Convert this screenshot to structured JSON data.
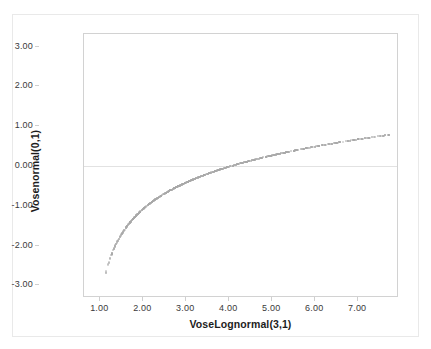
{
  "chart_data": {
    "type": "scatter",
    "title": "",
    "xlabel": "VoseLognormal(3,1)",
    "ylabel": "Vosenormal(0,1)",
    "xlim": [
      0.62,
      7.95
    ],
    "ylim": [
      -3.32,
      3.32
    ],
    "xticks": [
      "1.00",
      "2.00",
      "3.00",
      "4.00",
      "5.00",
      "6.00",
      "7.00"
    ],
    "xtick_values": [
      1,
      2,
      3,
      4,
      5,
      6,
      7
    ],
    "yticks": [
      "3.00",
      "2.00",
      "1.00",
      "0.00",
      "-1.00",
      "-2.00",
      "-3.00"
    ],
    "ytick_values": [
      3,
      2,
      1,
      0,
      -1,
      -2,
      -3
    ],
    "grid": false,
    "zero_gridline": true,
    "legend": null,
    "point_color": "#a8a8a8",
    "point_size_px": 2,
    "n_points": 760,
    "relation": "y = ln(x) - 3",
    "x_distribution": "lognormal(3,1)",
    "y_distribution": "normal(0,1)",
    "x_range_observed": [
      1.15,
      7.55
    ],
    "y_range_observed": [
      -2.95,
      3.02
    ]
  },
  "figure": {
    "border_color": "#e9e9e9",
    "frame_color": "#d2d2d2",
    "background": "#ffffff"
  }
}
